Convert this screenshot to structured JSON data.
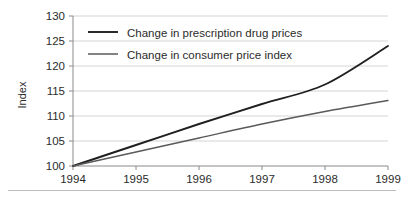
{
  "figure": {
    "background_color": "#ffffff",
    "footer_rule_color": "#bdbdbd"
  },
  "axes": {
    "y_axis_title": "Index",
    "y_tick_labels": [
      "100",
      "105",
      "110",
      "115",
      "120",
      "125",
      "130"
    ],
    "x_tick_labels": [
      "1994",
      "1995",
      "1996",
      "1997",
      "1998",
      "1999"
    ],
    "gridline_color": "#c9c9c9",
    "axis_color": "#8a8a8a"
  },
  "legend": {
    "items": [
      {
        "label": "Change in prescription drug prices",
        "color": "#1f1f1f"
      },
      {
        "label": "Change in consumer price index",
        "color": "#5a5a5a"
      }
    ]
  },
  "chart_data": {
    "type": "line",
    "title": "",
    "subtitle": "",
    "xlabel": "",
    "ylabel": "Index",
    "x": [
      1994,
      1995,
      1996,
      1997,
      1998,
      1999
    ],
    "categories": [
      "1994",
      "1995",
      "1996",
      "1997",
      "1998",
      "1999"
    ],
    "xlim": [
      1994,
      1999
    ],
    "ylim": [
      100,
      130
    ],
    "y_ticks": [
      100,
      105,
      110,
      115,
      120,
      125,
      130
    ],
    "x_ticks": [
      1994,
      1995,
      1996,
      1997,
      1998,
      1999
    ],
    "grid": "horizontal",
    "legend_position": "inside-top-left",
    "series": [
      {
        "name": "Change in prescription drug prices",
        "color": "#1f1f1f",
        "line_width": 1.9,
        "values": [
          100,
          104.2,
          108.4,
          112.4,
          116.3,
          124.0
        ]
      },
      {
        "name": "Change in consumer price index",
        "color": "#5a5a5a",
        "line_width": 1.5,
        "values": [
          100,
          102.8,
          105.6,
          108.4,
          110.9,
          113.1
        ]
      }
    ],
    "annotations": []
  }
}
